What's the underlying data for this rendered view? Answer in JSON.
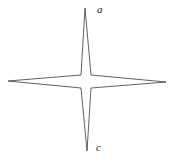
{
  "figure": {
    "name": "four-pointed-star-diagram",
    "background_color": "#ffffff",
    "stroke_color": "#3a3a3a",
    "stroke_width": 0.8,
    "fill_color": "none"
  },
  "labels": [
    {
      "id": "a",
      "text": "a",
      "position": "top",
      "x": 97,
      "y": 4
    },
    {
      "id": "c",
      "text": "c",
      "position": "bottom",
      "x": 96,
      "y": 142
    }
  ],
  "chart_data": {
    "type": "line",
    "title": "",
    "subtitle": "",
    "xlabel": "",
    "ylabel": "",
    "grid": false,
    "legend": "none",
    "center": {
      "x": 86,
      "y": 81
    },
    "inner_square": {
      "half_width": 5,
      "half_height": 6
    },
    "tips": {
      "top": {
        "x": 85,
        "y": 8,
        "label": "a"
      },
      "bottom": {
        "x": 87,
        "y": 151,
        "label": "c"
      },
      "left": {
        "x": 8,
        "y": 81,
        "label": ""
      },
      "right": {
        "x": 166,
        "y": 82,
        "label": ""
      }
    },
    "outline_points": [
      [
        85,
        8
      ],
      [
        91,
        75
      ],
      [
        166,
        82
      ],
      [
        91,
        88
      ],
      [
        87,
        151
      ],
      [
        81,
        88
      ],
      [
        8,
        81
      ],
      [
        81,
        75
      ]
    ],
    "axis_line_vertical": {
      "x1": 85,
      "y1": 8,
      "x2": 87,
      "y2": 151
    },
    "axis_line_horizontal": {
      "x1": 8,
      "y1": 81,
      "x2": 166,
      "y2": 82
    }
  }
}
